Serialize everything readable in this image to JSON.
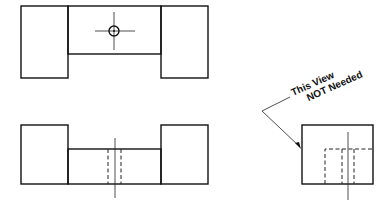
{
  "diagram": {
    "views": [
      {
        "name": "top-view",
        "label": ""
      },
      {
        "name": "front-view",
        "label": ""
      },
      {
        "name": "right-side-view",
        "label": ""
      }
    ],
    "annotation": {
      "line1": "This View",
      "line2": "NOT Needed"
    },
    "colors": {
      "line": "#111111",
      "background": "#ffffff"
    }
  }
}
